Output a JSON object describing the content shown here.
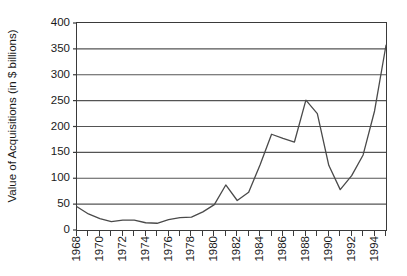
{
  "chart_data": {
    "type": "line",
    "title": "",
    "xlabel": "",
    "ylabel": "Value of Acquisitions (in $ billions)",
    "xlim": [
      1968,
      1995
    ],
    "ylim": [
      0,
      400
    ],
    "ytick_labels": [
      "0",
      "50",
      "100",
      "150",
      "200",
      "250",
      "300",
      "350",
      "400"
    ],
    "ytick_values": [
      0,
      50,
      100,
      150,
      200,
      250,
      300,
      350,
      400
    ],
    "xtick_labels": [
      "1968",
      "1970",
      "1972",
      "1974",
      "1976",
      "1978",
      "1980",
      "1982",
      "1984",
      "1986",
      "1988",
      "1990",
      "1992",
      "1994"
    ],
    "xtick_values": [
      1968,
      1970,
      1972,
      1974,
      1976,
      1978,
      1980,
      1982,
      1984,
      1986,
      1988,
      1990,
      1992,
      1994
    ],
    "minor_xticks": [
      1968,
      1969,
      1970,
      1971,
      1972,
      1973,
      1974,
      1975,
      1976,
      1977,
      1978,
      1979,
      1980,
      1981,
      1982,
      1983,
      1984,
      1985,
      1986,
      1987,
      1988,
      1989,
      1990,
      1991,
      1992,
      1993,
      1994,
      1995
    ],
    "grid": "horizontal",
    "legend": "none",
    "line_color": "#4a4a4a",
    "axis_color": "#3a3a3a",
    "background": "#ffffff",
    "x": [
      1968,
      1969,
      1970,
      1971,
      1972,
      1973,
      1974,
      1975,
      1976,
      1977,
      1978,
      1979,
      1980,
      1981,
      1982,
      1983,
      1984,
      1985,
      1986,
      1987,
      1988,
      1989,
      1990,
      1991,
      1992,
      1993,
      1994,
      1995
    ],
    "values": [
      45,
      31,
      22,
      16,
      19,
      19,
      14,
      13,
      20,
      24,
      25,
      35,
      49,
      87,
      57,
      73,
      126,
      185,
      177,
      170,
      251,
      225,
      125,
      78,
      105,
      145,
      230,
      357
    ],
    "series": [
      {
        "name": "Value of Acquisitions",
        "values": [
          45,
          31,
          22,
          16,
          19,
          19,
          14,
          13,
          20,
          24,
          25,
          35,
          49,
          87,
          57,
          73,
          126,
          185,
          177,
          170,
          251,
          225,
          125,
          78,
          105,
          145,
          230,
          357
        ]
      }
    ],
    "annotations": []
  }
}
